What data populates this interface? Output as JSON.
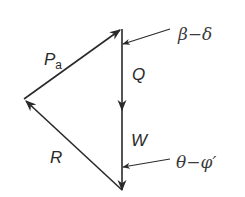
{
  "diagram": {
    "stroke_color": "#2a2a2a",
    "background": "#ffffff",
    "vertices": {
      "top": [
        122,
        29
      ],
      "left": [
        24,
        99
      ],
      "bottom": [
        122,
        190
      ]
    },
    "vectors": [
      {
        "name": "Pa",
        "label_main": "P",
        "label_sub": "a",
        "from": "left",
        "to": "top"
      },
      {
        "name": "Q",
        "label": "Q",
        "from": "top",
        "to": "mid"
      },
      {
        "name": "W",
        "label": "W",
        "from": "mid",
        "to": "bottom"
      },
      {
        "name": "R",
        "label": "R",
        "from": "bottom",
        "to": "left"
      }
    ],
    "angle_annotations": [
      {
        "label": "β − δ",
        "text": "β−δ"
      },
      {
        "label": "θ − φ′",
        "text": "θ−φ′"
      }
    ]
  }
}
